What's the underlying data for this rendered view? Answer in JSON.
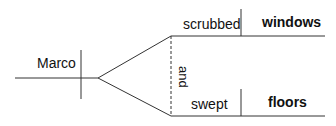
{
  "diagram": {
    "type": "sentence-diagram",
    "subject": "Marco",
    "conjunction": "and",
    "predicates": [
      {
        "verb": "scrubbed",
        "object": "windows"
      },
      {
        "verb": "swept",
        "object": "floors"
      }
    ]
  },
  "colors": {
    "line": "#333333",
    "text": "#111111",
    "background": "#ffffff"
  }
}
